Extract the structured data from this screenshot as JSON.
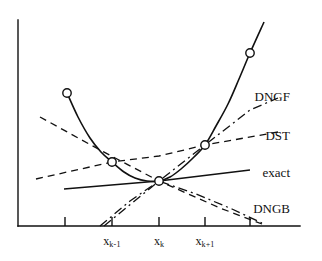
{
  "figure": {
    "background_color": "#ffffff",
    "ink_color": "#111111"
  },
  "axes": {
    "x_axis": {
      "y": 226,
      "x_start": 18,
      "x_end": 300
    },
    "y_axis": {
      "x": 18,
      "y_start": 20,
      "y_end": 226
    },
    "tick_length": 9,
    "tick_positions": [
      65,
      112,
      159,
      205,
      250
    ],
    "grid": false
  },
  "x_tick_labels": [
    {
      "base": "x",
      "sub": "k-1",
      "x": 112
    },
    {
      "base": "x",
      "sub": "k",
      "x": 159
    },
    {
      "base": "x",
      "sub": "k+1",
      "x": 205
    }
  ],
  "curve_labels": [
    {
      "text": "DNGF",
      "x": 290,
      "y": 96,
      "name": "dngf"
    },
    {
      "text": "DST",
      "x": 290,
      "y": 135,
      "name": "dst"
    },
    {
      "text": "exact",
      "x": 290,
      "y": 172,
      "name": "exact"
    },
    {
      "text": "DNGB",
      "x": 290,
      "y": 208,
      "name": "dngb"
    }
  ],
  "chart_data": {
    "type": "line",
    "xlabel": "",
    "ylabel": "",
    "grid": false,
    "legend_position": "right-inline",
    "axis_pixel_frame": {
      "x_min": 18,
      "x_max": 300,
      "y_min": 20,
      "y_max": 226
    },
    "x_ticks": [
      {
        "pixel_x": 65,
        "label": ""
      },
      {
        "pixel_x": 112,
        "label": "x_{k-1}"
      },
      {
        "pixel_x": 159,
        "label": "x_k"
      },
      {
        "pixel_x": 205,
        "label": "x_{k+1}"
      },
      {
        "pixel_x": 250,
        "label": ""
      }
    ],
    "series": [
      {
        "name": "objective function",
        "style": "solid",
        "stroke_width": 1.6,
        "markers": "open-circle",
        "points": [
          [
            67,
            93
          ],
          [
            78,
            117
          ],
          [
            90,
            138
          ],
          [
            101,
            152
          ],
          [
            112,
            162
          ],
          [
            124,
            172
          ],
          [
            135,
            178
          ],
          [
            147,
            181
          ],
          [
            159,
            181
          ],
          [
            170,
            177
          ],
          [
            181,
            169
          ],
          [
            193,
            158
          ],
          [
            205,
            145
          ],
          [
            216,
            126
          ],
          [
            228,
            104
          ],
          [
            239,
            79
          ],
          [
            250,
            53
          ],
          [
            264,
            22
          ]
        ],
        "marker_points": [
          [
            67,
            93
          ],
          [
            112,
            162
          ],
          [
            159,
            181
          ],
          [
            205,
            145
          ],
          [
            250,
            53
          ]
        ]
      },
      {
        "name": "DST",
        "style": "dashed",
        "stroke_width": 1.3,
        "markers": "none",
        "points": [
          [
            36,
            179
          ],
          [
            112,
            162
          ],
          [
            159,
            156
          ],
          [
            205,
            145
          ],
          [
            278,
            132
          ]
        ]
      },
      {
        "name": "DST-secondary",
        "style": "dashed",
        "stroke_width": 1.3,
        "markers": "none",
        "points": [
          [
            40,
            117
          ],
          [
            100,
            150
          ],
          [
            159,
            181
          ],
          [
            220,
            208
          ],
          [
            262,
            224
          ]
        ]
      },
      {
        "name": "DNGF",
        "style": "dash-dot",
        "stroke_width": 1.3,
        "markers": "none",
        "points": [
          [
            104,
            226
          ],
          [
            132,
            203
          ],
          [
            159,
            181
          ],
          [
            205,
            145
          ],
          [
            250,
            110
          ],
          [
            278,
            98
          ]
        ]
      },
      {
        "name": "DNGB",
        "style": "dash-dot",
        "stroke_width": 1.3,
        "markers": "none",
        "points": [
          [
            100,
            226
          ],
          [
            130,
            201
          ],
          [
            159,
            181
          ],
          [
            196,
            194
          ],
          [
            232,
            209
          ],
          [
            262,
            223
          ]
        ]
      },
      {
        "name": "exact",
        "style": "solid",
        "stroke_width": 1.6,
        "markers": "none",
        "points": [
          [
            64,
            189
          ],
          [
            159,
            181
          ],
          [
            250,
            170
          ]
        ]
      }
    ]
  }
}
